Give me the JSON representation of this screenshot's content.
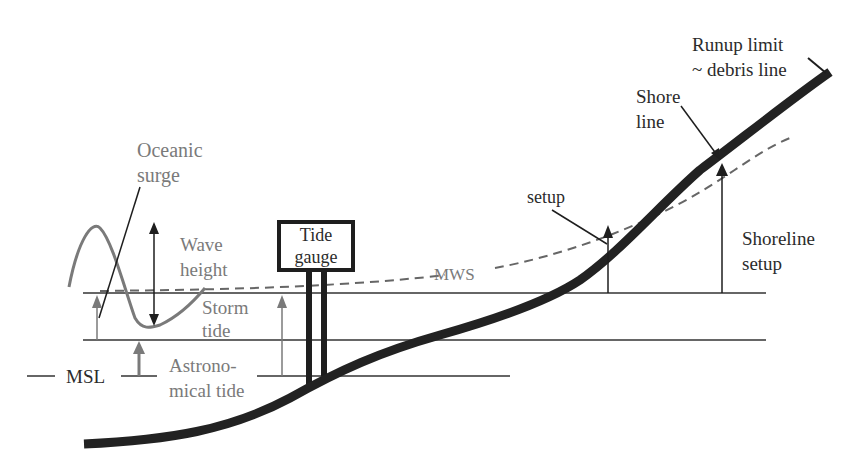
{
  "diagram": {
    "colors": {
      "background": "#ffffff",
      "ink": "#1e1e1e",
      "gray_ink": "#7a7a7a",
      "profile": "#222222"
    },
    "labels": {
      "oceanic_surge": "Oceanic\nsurge",
      "wave_height": "Wave\nheight",
      "storm_tide": "Storm\ntide",
      "astronomical_tide": "Astrono-\nmical tide",
      "msl": "MSL",
      "tide_gauge": "Tide\ngauge",
      "mws": "MWS",
      "setup": "setup",
      "shoreline_setup": "Shoreline\nsetup",
      "shore_line": "Shore\nline",
      "runup_limit": "Runup limit\n~ debris line"
    },
    "levels": {
      "msl_y": 376,
      "astronomical_tide_y": 340,
      "storm_tide_y": 293
    },
    "elements": [
      {
        "name": "Mean Sea Level (MSL)",
        "type": "reference-line"
      },
      {
        "name": "Astronomical tide level",
        "type": "horizontal-line"
      },
      {
        "name": "Storm tide level",
        "type": "horizontal-line"
      },
      {
        "name": "Mean Water Surface (MWS)",
        "type": "dashed-curve"
      },
      {
        "name": "Beach profile",
        "type": "thick-curve"
      },
      {
        "name": "Tide gauge",
        "type": "box-on-stilts"
      },
      {
        "name": "Wave",
        "type": "sinusoid"
      }
    ]
  }
}
